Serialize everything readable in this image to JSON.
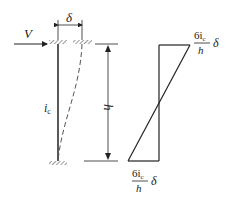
{
  "diagram": {
    "left": {
      "load_label": "V",
      "displacement_label": "δ",
      "stiffness_label": "i",
      "stiffness_sub": "c",
      "height_label": "h"
    },
    "right": {
      "top_moment": {
        "num": "6i",
        "num_sub": "c",
        "den": "h",
        "factor": "δ"
      },
      "bottom_moment": {
        "num": "6i",
        "num_sub": "c",
        "den": "h",
        "factor": "δ"
      }
    }
  }
}
